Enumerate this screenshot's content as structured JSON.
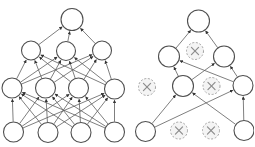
{
  "page": {
    "width": 254,
    "height": 147,
    "background": "#ffffff"
  },
  "figure": {
    "colors": {
      "background": "#ffffff",
      "node_fill": "#ffffff",
      "node_stroke": "#4f4f4f",
      "edge": "#5e5e5e",
      "arrow": "#343434",
      "dropped_fill": "#f4f4f4",
      "dropped_stroke": "#a3a3a3",
      "dropped_x": "#8c8c8c"
    },
    "style": {
      "edge_width": 0.8,
      "node_stroke_width": 1.1,
      "dropped_stroke_width": 1.0,
      "dropped_dash": "2 1.7",
      "x_mark_width": 1.2,
      "x_mark_scale": 0.42
    },
    "networks": [
      {
        "id": "standard-network",
        "nodes": [
          {
            "id": "o1",
            "x": 72,
            "y": 19.5,
            "r": 11,
            "state": "active"
          },
          {
            "id": "a1",
            "x": 31,
            "y": 50.5,
            "r": 9.5,
            "state": "active"
          },
          {
            "id": "a2",
            "x": 66,
            "y": 51,
            "r": 9.5,
            "state": "active"
          },
          {
            "id": "a3",
            "x": 102,
            "y": 50.5,
            "r": 9.5,
            "state": "active"
          },
          {
            "id": "h1",
            "x": 12,
            "y": 88,
            "r": 10,
            "state": "active"
          },
          {
            "id": "h2",
            "x": 45.5,
            "y": 88,
            "r": 10,
            "state": "active"
          },
          {
            "id": "h3",
            "x": 78.5,
            "y": 88,
            "r": 10,
            "state": "active"
          },
          {
            "id": "h4",
            "x": 114.5,
            "y": 89,
            "r": 10,
            "state": "active"
          },
          {
            "id": "i1",
            "x": 13.5,
            "y": 132,
            "r": 10,
            "state": "active"
          },
          {
            "id": "i2",
            "x": 48,
            "y": 132.5,
            "r": 10,
            "state": "active"
          },
          {
            "id": "i3",
            "x": 81,
            "y": 132.5,
            "r": 10,
            "state": "active"
          },
          {
            "id": "i4",
            "x": 114.5,
            "y": 132,
            "r": 10,
            "state": "active"
          }
        ],
        "edges": [
          [
            "i1",
            "h1"
          ],
          [
            "i1",
            "h2"
          ],
          [
            "i1",
            "h3"
          ],
          [
            "i1",
            "h4"
          ],
          [
            "i2",
            "h1"
          ],
          [
            "i2",
            "h2"
          ],
          [
            "i2",
            "h3"
          ],
          [
            "i2",
            "h4"
          ],
          [
            "i3",
            "h1"
          ],
          [
            "i3",
            "h2"
          ],
          [
            "i3",
            "h3"
          ],
          [
            "i3",
            "h4"
          ],
          [
            "i4",
            "h1"
          ],
          [
            "i4",
            "h2"
          ],
          [
            "i4",
            "h3"
          ],
          [
            "i4",
            "h4"
          ],
          [
            "h1",
            "a1"
          ],
          [
            "h1",
            "a2"
          ],
          [
            "h1",
            "a3"
          ],
          [
            "h2",
            "a1"
          ],
          [
            "h2",
            "a2"
          ],
          [
            "h2",
            "a3"
          ],
          [
            "h3",
            "a1"
          ],
          [
            "h3",
            "a2"
          ],
          [
            "h3",
            "a3"
          ],
          [
            "h4",
            "a1"
          ],
          [
            "h4",
            "a2"
          ],
          [
            "h4",
            "a3"
          ],
          [
            "a1",
            "o1"
          ],
          [
            "a2",
            "o1"
          ],
          [
            "a3",
            "o1"
          ]
        ]
      },
      {
        "id": "dropout-network",
        "nodes": [
          {
            "id": "t",
            "x": 198.5,
            "y": 21,
            "r": 11,
            "state": "active"
          },
          {
            "id": "g1",
            "x": 169,
            "y": 56.5,
            "r": 10.5,
            "state": "active"
          },
          {
            "id": "gx",
            "x": 195,
            "y": 51,
            "r": 8.5,
            "state": "dropped"
          },
          {
            "id": "g3",
            "x": 224,
            "y": 56.5,
            "r": 10.5,
            "state": "active"
          },
          {
            "id": "hx1",
            "x": 147,
            "y": 87,
            "r": 8.5,
            "state": "dropped"
          },
          {
            "id": "h2",
            "x": 183,
            "y": 86,
            "r": 10.5,
            "state": "active"
          },
          {
            "id": "hx2",
            "x": 211.5,
            "y": 86,
            "r": 8.5,
            "state": "dropped"
          },
          {
            "id": "h4",
            "x": 243,
            "y": 85.5,
            "r": 10,
            "state": "active"
          },
          {
            "id": "b1",
            "x": 145.5,
            "y": 131.5,
            "r": 10,
            "state": "active"
          },
          {
            "id": "bx1",
            "x": 179,
            "y": 130.5,
            "r": 8.5,
            "state": "dropped"
          },
          {
            "id": "bx2",
            "x": 211,
            "y": 130.5,
            "r": 8.5,
            "state": "dropped"
          },
          {
            "id": "b4",
            "x": 244,
            "y": 130.5,
            "r": 10,
            "state": "active"
          }
        ],
        "edges": [
          [
            "b1",
            "h2"
          ],
          [
            "b1",
            "h4"
          ],
          [
            "b4",
            "h2"
          ],
          [
            "b4",
            "h4"
          ],
          [
            "h2",
            "g1"
          ],
          [
            "h2",
            "g3"
          ],
          [
            "h4",
            "g1"
          ],
          [
            "h4",
            "g3"
          ],
          [
            "g1",
            "t"
          ],
          [
            "g3",
            "t"
          ]
        ]
      }
    ]
  }
}
